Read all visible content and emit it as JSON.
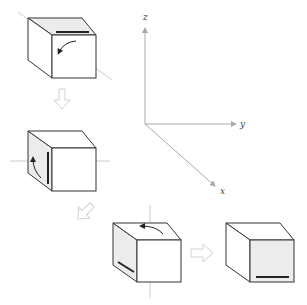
{
  "diagram": {
    "axes": {
      "labels": {
        "z": "z",
        "y": "y",
        "x": "x"
      },
      "color": "#aaaaaa"
    },
    "colors": {
      "edge": "#333333",
      "shaded_face": "#ececec",
      "guide_line": "#cccccc",
      "block_arrow": "#d6d6d6",
      "marker_bar": "#222222"
    },
    "steps": [
      {
        "id": 1,
        "shaded_face": "top",
        "marker_face": "top",
        "rotation_arrow": "front-face-curved-ccw"
      },
      {
        "id": 2,
        "shaded_face": "left",
        "marker_face": "left",
        "rotation_arrow": "left-face-curved-up"
      },
      {
        "id": 3,
        "shaded_face": "left",
        "marker_face": "left",
        "rotation_arrow": "top-face-curved-left"
      },
      {
        "id": 4,
        "shaded_face": "front",
        "marker_face": "front",
        "rotation_arrow": "none"
      }
    ]
  }
}
